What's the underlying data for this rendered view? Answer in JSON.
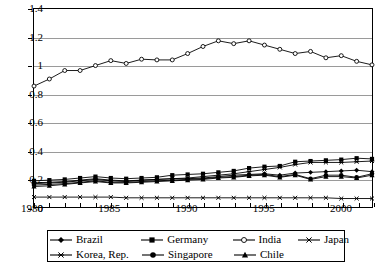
{
  "chart_data": {
    "type": "line",
    "title": "",
    "xlabel": "",
    "ylabel": "",
    "xlim": [
      1980,
      2002
    ],
    "ylim": [
      0,
      1.4
    ],
    "ytick_labels": [
      "0",
      "0.2",
      "0.4",
      "0.6",
      "0.8",
      "1",
      "1.2",
      "1.4"
    ],
    "ytick_values": [
      0,
      0.2,
      0.4,
      0.6,
      0.8,
      1.0,
      1.2,
      1.4
    ],
    "xtick_labels": [
      "1980",
      "1985",
      "1990",
      "1995",
      "2000"
    ],
    "xtick_values": [
      1980,
      1985,
      1990,
      1995,
      2000
    ],
    "grid": true,
    "legend_position": "bottom",
    "x": [
      1980,
      1981,
      1982,
      1983,
      1984,
      1985,
      1986,
      1987,
      1988,
      1989,
      1990,
      1991,
      1992,
      1993,
      1994,
      1995,
      1996,
      1997,
      1998,
      1999,
      2000,
      2001,
      2002
    ],
    "series": [
      {
        "name": "Brazil",
        "marker": "diamond",
        "color": "#000000",
        "values": [
          0.17,
          0.175,
          0.18,
          0.19,
          0.2,
          0.19,
          0.185,
          0.19,
          0.195,
          0.2,
          0.2,
          0.205,
          0.215,
          0.225,
          0.23,
          0.235,
          0.225,
          0.24,
          0.245,
          0.25,
          0.255,
          0.26,
          0.25
        ]
      },
      {
        "name": "Germany",
        "marker": "square",
        "color": "#000000",
        "values": [
          0.185,
          0.19,
          0.195,
          0.205,
          0.215,
          0.205,
          0.2,
          0.205,
          0.21,
          0.225,
          0.23,
          0.235,
          0.245,
          0.255,
          0.275,
          0.285,
          0.29,
          0.32,
          0.325,
          0.33,
          0.335,
          0.345,
          0.34
        ]
      },
      {
        "name": "India",
        "marker": "circle-open",
        "color": "#000000",
        "values": [
          0.855,
          0.905,
          0.965,
          0.965,
          1.0,
          1.035,
          1.015,
          1.045,
          1.04,
          1.04,
          1.085,
          1.135,
          1.175,
          1.155,
          1.175,
          1.145,
          1.115,
          1.085,
          1.1,
          1.055,
          1.07,
          1.03,
          1.005
        ]
      },
      {
        "name": "Japan",
        "marker": "x",
        "color": "#000000",
        "values": [
          0.07,
          0.07,
          0.07,
          0.07,
          0.07,
          0.07,
          0.065,
          0.065,
          0.065,
          0.065,
          0.065,
          0.065,
          0.065,
          0.065,
          0.065,
          0.065,
          0.065,
          0.065,
          0.065,
          0.065,
          0.06,
          0.06,
          0.06
        ]
      },
      {
        "name": "Korea, Rep.",
        "marker": "asterisk",
        "color": "#000000",
        "values": [
          0.165,
          0.17,
          0.175,
          0.185,
          0.195,
          0.185,
          0.18,
          0.19,
          0.195,
          0.2,
          0.205,
          0.215,
          0.225,
          0.235,
          0.25,
          0.265,
          0.28,
          0.3,
          0.315,
          0.315,
          0.315,
          0.32,
          0.325
        ]
      },
      {
        "name": "Singapore",
        "marker": "circle",
        "color": "#000000",
        "values": [
          0.155,
          0.16,
          0.165,
          0.175,
          0.185,
          0.175,
          0.175,
          0.18,
          0.185,
          0.19,
          0.195,
          0.2,
          0.21,
          0.215,
          0.225,
          0.23,
          0.215,
          0.23,
          0.2,
          0.225,
          0.225,
          0.21,
          0.235
        ]
      },
      {
        "name": "Chile",
        "marker": "triangle",
        "color": "#000000",
        "values": [
          0.145,
          0.15,
          0.16,
          0.17,
          0.18,
          0.17,
          0.17,
          0.175,
          0.18,
          0.185,
          0.19,
          0.195,
          0.205,
          0.21,
          0.22,
          0.225,
          0.21,
          0.225,
          0.195,
          0.215,
          0.215,
          0.205,
          0.225
        ]
      }
    ]
  },
  "legend": {
    "rows": [
      [
        {
          "label": "Brazil",
          "marker": "diamond"
        },
        {
          "label": "Germany",
          "marker": "square"
        },
        {
          "label": "India",
          "marker": "circle-open"
        },
        {
          "label": "Japan",
          "marker": "x"
        }
      ],
      [
        {
          "label": "Korea, Rep.",
          "marker": "asterisk"
        },
        {
          "label": "Singapore",
          "marker": "circle"
        },
        {
          "label": "Chile",
          "marker": "triangle"
        }
      ]
    ]
  }
}
